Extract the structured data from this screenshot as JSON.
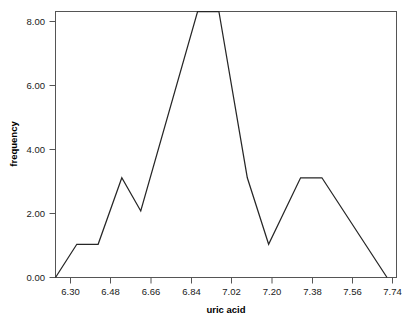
{
  "chart_data": {
    "type": "line",
    "title": "",
    "xlabel": "uric acid",
    "ylabel": "frequency",
    "xlim": [
      6.3,
      7.74
    ],
    "ylim": [
      0.0,
      8.0
    ],
    "grid": false,
    "legend": null,
    "xticks": [
      "6.30",
      "6.48",
      "6.66",
      "6.84",
      "7.02",
      "7.20",
      "7.38",
      "7.56",
      "7.74"
    ],
    "xtick_values": [
      6.3,
      6.48,
      6.66,
      6.84,
      7.02,
      7.2,
      7.38,
      7.56,
      7.74
    ],
    "yticks": [
      "0.00",
      "2.00",
      "4.00",
      "6.00",
      "8.00"
    ],
    "ytick_values": [
      0,
      2,
      4,
      6,
      8
    ],
    "series": [
      {
        "name": "frequency polygon",
        "x": [
          6.3,
          6.39,
          6.48,
          6.58,
          6.66,
          6.9,
          6.99,
          7.11,
          7.2,
          7.335,
          7.425,
          7.7
        ],
        "values": [
          0,
          1,
          1,
          3,
          2,
          8,
          8,
          3,
          1,
          3,
          3,
          0
        ]
      }
    ],
    "line_color": "#262626",
    "frame_color": "#555555"
  }
}
